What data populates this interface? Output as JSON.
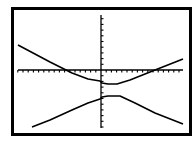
{
  "chart_data": {
    "type": "line",
    "title": "",
    "xlabel": "",
    "ylabel": "",
    "grid": false,
    "legend": null,
    "xlim": [
      -16,
      16
    ],
    "ylim": [
      -10,
      10
    ],
    "x_tick_count_per_side": 16,
    "y_tick_count_per_side": 10,
    "series": [
      {
        "name": "upper-branch",
        "x": [
          -16,
          -10,
          -6,
          -3,
          -0.2,
          0.2,
          1,
          3,
          6,
          10,
          16
        ],
        "y": [
          4.4,
          1.2,
          -1.2,
          -2.6,
          -2.8,
          -3.4,
          -3.5,
          -3.4,
          -2.3,
          -0.4,
          2.1
        ]
      },
      {
        "name": "lower-branch",
        "x": [
          -13.5,
          -10,
          -6,
          -3,
          -0.2,
          0.2,
          1,
          3,
          6,
          10,
          16
        ],
        "y": [
          -10,
          -8.7,
          -6.8,
          -5.4,
          -5.0,
          -4.5,
          -4.4,
          -4.4,
          -5.6,
          -7.4,
          -9.7
        ]
      }
    ]
  },
  "screen": {
    "colors": {
      "background": "#ffffff",
      "ink": "#000000"
    },
    "frame": {
      "x": 11,
      "y": 7,
      "w": 181,
      "h": 129,
      "border": 3
    },
    "x_axis": {
      "y": 70,
      "x1": 18,
      "x2": 183,
      "tick_spacing": 5.2
    },
    "y_axis": {
      "x": 101,
      "y1": 15,
      "y2": 128,
      "tick_spacing": 5.7
    },
    "upper_branch_points": [
      [
        18,
        45
      ],
      [
        50,
        62
      ],
      [
        72,
        73
      ],
      [
        88,
        79
      ],
      [
        100,
        81
      ],
      [
        102,
        83
      ],
      [
        108,
        84
      ],
      [
        117,
        84
      ],
      [
        130,
        80
      ],
      [
        150,
        72
      ],
      [
        183,
        59
      ]
    ],
    "lower_branch_points": [
      [
        32,
        127
      ],
      [
        50,
        120
      ],
      [
        72,
        110
      ],
      [
        88,
        103
      ],
      [
        100,
        99
      ],
      [
        102,
        97
      ],
      [
        108,
        96
      ],
      [
        120,
        96
      ],
      [
        135,
        103
      ],
      [
        155,
        113
      ],
      [
        183,
        124
      ]
    ]
  }
}
